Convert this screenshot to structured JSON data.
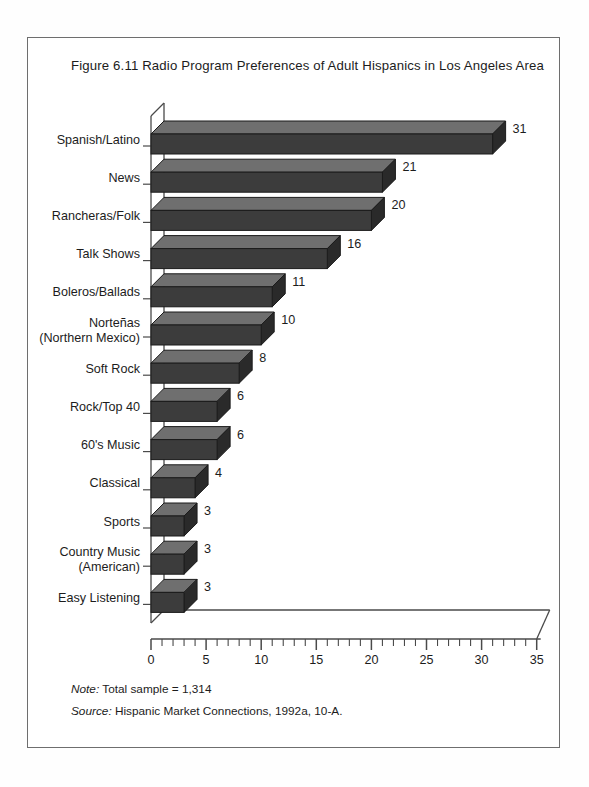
{
  "figure": {
    "title": "Figure 6.11  Radio Program Preferences of Adult Hispanics in Los Angeles Area",
    "note_prefix": "Note:",
    "note_text": " Total sample = 1,314",
    "source_prefix": "Source:",
    "source_text": " Hispanic Market Connections, 1992a, 10-A."
  },
  "colors": {
    "bar_front": "#3c3c3c",
    "bar_top": "#6f6f6f",
    "bar_side": "#2a2a2a",
    "outline": "#1b1b1b",
    "axis": "#4a4a4a",
    "frame": "#6e6e6e",
    "text": "#1c1c1c",
    "background": "#ffffff"
  },
  "chart_data": {
    "type": "bar",
    "orientation": "horizontal",
    "title": "Figure 6.11  Radio Program Preferences of Adult Hispanics in Los Angeles Area",
    "xlabel": "",
    "ylabel": "",
    "xlim": [
      0,
      35
    ],
    "grid": false,
    "legend": "none",
    "xticks": [
      0,
      5,
      10,
      15,
      20,
      25,
      30,
      35
    ],
    "minor_tick_interval": 1,
    "categories": [
      "Spanish/Latino",
      "News",
      "Rancheras/Folk",
      "Talk Shows",
      "Boleros/Ballads",
      "Norteñas\n(Northern Mexico)",
      "Soft Rock",
      "Rock/Top 40",
      "60's Music",
      "Classical",
      "Sports",
      "Country Music\n(American)",
      "Easy Listening"
    ],
    "category_lines": [
      [
        "Spanish/Latino"
      ],
      [
        "News"
      ],
      [
        "Rancheras/Folk"
      ],
      [
        "Talk Shows"
      ],
      [
        "Boleros/Ballads"
      ],
      [
        "Norteñas",
        "(Northern Mexico)"
      ],
      [
        "Soft Rock"
      ],
      [
        "Rock/Top 40"
      ],
      [
        "60's Music"
      ],
      [
        "Classical"
      ],
      [
        "Sports"
      ],
      [
        "Country Music",
        "(American)"
      ],
      [
        "Easy Listening"
      ]
    ],
    "values": [
      31,
      21,
      20,
      16,
      11,
      10,
      8,
      6,
      6,
      4,
      3,
      3,
      3
    ],
    "value_labels": [
      "31",
      "21",
      "20",
      "16",
      "11",
      "10",
      "8",
      "6",
      "6",
      "4",
      "3",
      "3",
      "3"
    ],
    "units": "percent of respondents"
  }
}
